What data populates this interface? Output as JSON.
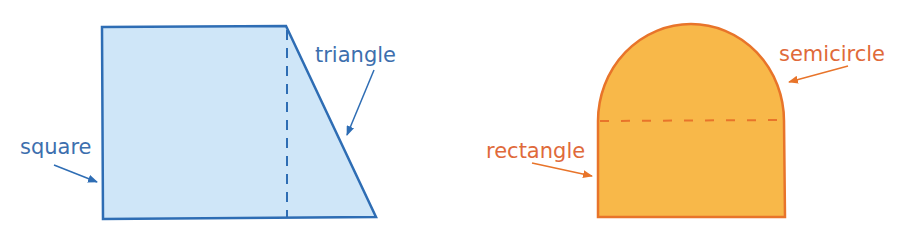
{
  "figures": [
    {
      "id": "composite-trapezoid",
      "fill": "#cfe6f8",
      "stroke": "#2e6db4",
      "labels": {
        "square": "square",
        "triangle": "triangle"
      },
      "label_color": "#3d6fae"
    },
    {
      "id": "composite-arch",
      "fill": "#f8b849",
      "stroke": "#e8742a",
      "labels": {
        "rectangle": "rectangle",
        "semicircle": "semicircle"
      },
      "label_color": "#e06a3a"
    }
  ]
}
